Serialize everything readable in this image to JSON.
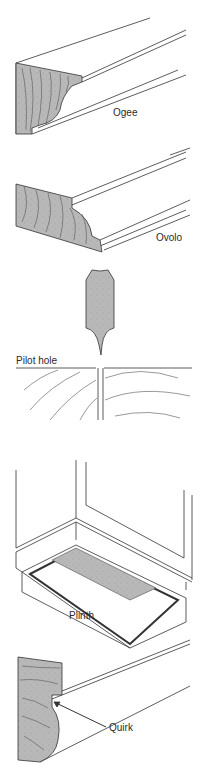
{
  "diagram": {
    "type": "woodworking-glossary-illustrations",
    "colors": {
      "line": "#333333",
      "hatch_fill": "#b8b8b8",
      "background": "#ffffff"
    },
    "figures": [
      {
        "id": "ogee",
        "label": "Ogee",
        "depicts": "ogee moulding profile, end grain shaded"
      },
      {
        "id": "ovolo",
        "label": "Ovolo",
        "depicts": "ovolo moulding profile, end grain shaded"
      },
      {
        "id": "pilot-hole",
        "label": "Pilot hole",
        "depicts": "drill bit above board with pilot hole"
      },
      {
        "id": "plinth",
        "label": "Plinth",
        "depicts": "cabinet base plinth, underside view"
      },
      {
        "id": "quirk",
        "label": "Quirk",
        "depicts": "moulding with quirk groove indicated by arrow"
      }
    ]
  }
}
